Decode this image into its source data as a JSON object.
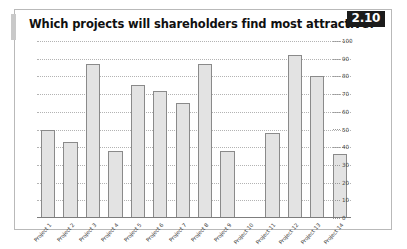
{
  "header": {
    "title": "Which projects will shareholders find most attractive?",
    "badge": "2.10"
  },
  "chart_data": {
    "type": "bar",
    "title": "Which projects will shareholders find most attractive?",
    "xlabel": "",
    "ylabel": "",
    "ylim": [
      0,
      100
    ],
    "yticks": [
      0,
      10,
      20,
      30,
      40,
      50,
      60,
      70,
      80,
      90,
      100
    ],
    "grid": true,
    "legend": false,
    "axis_position": "right",
    "bar_fill_color": "#e3e3e3",
    "bar_border_color": "#8a8a8a",
    "categories": [
      "Project 1",
      "Project 2",
      "Project 3",
      "Project 4",
      "Project 5",
      "Project 6",
      "Project 7",
      "Project 8",
      "Project 9",
      "Project 10",
      "Project 11",
      "Project 12",
      "Project 13",
      "Project 14"
    ],
    "values": [
      50,
      43,
      87,
      38,
      75,
      72,
      65,
      87,
      38,
      0,
      48,
      92,
      80,
      36
    ]
  }
}
